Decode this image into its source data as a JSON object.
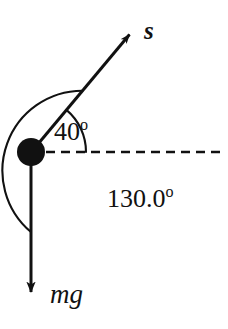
{
  "figure": {
    "background_color": "#ffffff",
    "stroke_color": "#111111",
    "width": 228,
    "height": 329
  },
  "particle": {
    "name": "particle-mass",
    "center_x": 31,
    "center_y": 152,
    "radius": 14,
    "fill_color": "#111111"
  },
  "reference_line": {
    "name": "horizontal-dashed-reference",
    "style": "dashed",
    "y": 152,
    "x_start": 31,
    "x_end": 222
  },
  "vectors": [
    {
      "id": "s",
      "label": "s",
      "description": "displacement vector",
      "origin_x": 31,
      "origin_y": 152,
      "tip_x": 133,
      "tip_y": 30,
      "angle_from_horizontal_deg": 50
    },
    {
      "id": "mg",
      "label": "mg",
      "description": "weight vector",
      "origin_x": 31,
      "origin_y": 166,
      "tip_x": 31,
      "tip_y": 301,
      "angle_from_horizontal_deg": -90
    }
  ],
  "angles": [
    {
      "id": "small",
      "value": "40",
      "degree_symbol": "o",
      "full_label": "40°",
      "arc_radius": 55,
      "from_deg": 0,
      "to_deg": 50,
      "description": "angle between displacement vector s and horizontal reference"
    },
    {
      "id": "large",
      "value": "130.0",
      "degree_symbol": "o",
      "full_label": "130.0°",
      "arc_radius": 80,
      "from_deg": -90,
      "to_deg": 50,
      "description": "angle between displacement vector s and weight vector mg"
    }
  ]
}
